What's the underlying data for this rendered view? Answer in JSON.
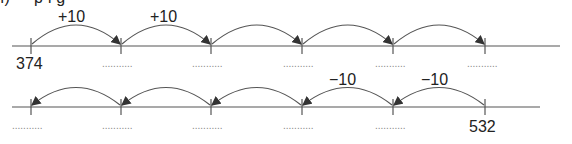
{
  "heading": "ı)   •    ·  p  ı  g",
  "line1": {
    "start_label": "374",
    "jump_labels": [
      "+10",
      "+10"
    ],
    "blank": "...........",
    "tick_count": 6
  },
  "line2": {
    "end_label": "532",
    "jump_labels": [
      "−10",
      "−10"
    ],
    "blank": "...........",
    "tick_count": 6
  },
  "colors": {
    "line": "#555555",
    "text": "#222222",
    "dots": "#888888"
  }
}
